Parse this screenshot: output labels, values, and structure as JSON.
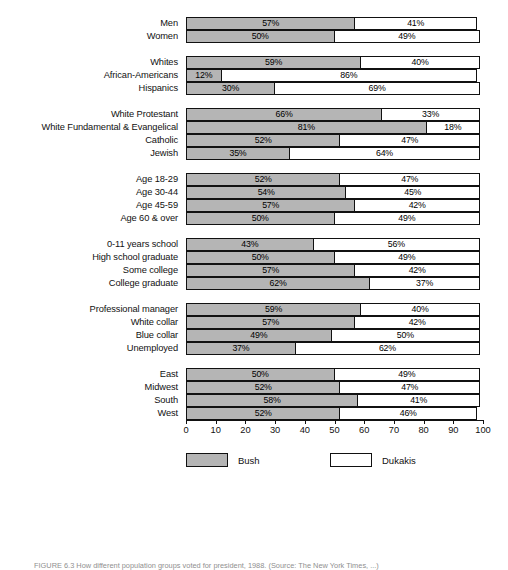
{
  "figure": {
    "caption": "FIGURE 6.3    How different population groups voted for president, 1988. (Source: The New York Times, ...)"
  },
  "legend": {
    "position": "bottom-center",
    "items": [
      {
        "name": "Bush",
        "color": "#b5b5b5"
      },
      {
        "name": "Dukakis",
        "color": "#ffffff"
      }
    ]
  },
  "axis": {
    "ticks": [
      "0",
      "10",
      "20",
      "30",
      "40",
      "50",
      "60",
      "70",
      "80",
      "90",
      "100"
    ],
    "min": 0,
    "max": 100
  },
  "chart_data": {
    "type": "bar",
    "orientation": "horizontal",
    "stacked": true,
    "title": "",
    "xlabel": "",
    "ylabel": "",
    "xlim": [
      0,
      100
    ],
    "grid": false,
    "legend_position": "bottom-center",
    "series": [
      {
        "name": "Bush",
        "color": "#b5b5b5"
      },
      {
        "name": "Dukakis",
        "color": "#ffffff"
      }
    ],
    "groups": [
      {
        "name": "Gender",
        "rows": [
          {
            "category": "Men",
            "bush": 57,
            "dukakis": 41,
            "bush_label": "57%",
            "dukakis_label": "41%"
          },
          {
            "category": "Women",
            "bush": 50,
            "dukakis": 49,
            "bush_label": "50%",
            "dukakis_label": "49%"
          }
        ]
      },
      {
        "name": "Race",
        "rows": [
          {
            "category": "Whites",
            "bush": 59,
            "dukakis": 40,
            "bush_label": "59%",
            "dukakis_label": "40%"
          },
          {
            "category": "African-Americans",
            "bush": 12,
            "dukakis": 86,
            "bush_label": "12%",
            "dukakis_label": "86%"
          },
          {
            "category": "Hispanics",
            "bush": 30,
            "dukakis": 69,
            "bush_label": "30%",
            "dukakis_label": "69%"
          }
        ]
      },
      {
        "name": "Religion",
        "rows": [
          {
            "category": "White Protestant",
            "bush": 66,
            "dukakis": 33,
            "bush_label": "66%",
            "dukakis_label": "33%"
          },
          {
            "category": "White Fundamental & Evangelical",
            "bush": 81,
            "dukakis": 18,
            "bush_label": "81%",
            "dukakis_label": "18%"
          },
          {
            "category": "Catholic",
            "bush": 52,
            "dukakis": 47,
            "bush_label": "52%",
            "dukakis_label": "47%"
          },
          {
            "category": "Jewish",
            "bush": 35,
            "dukakis": 64,
            "bush_label": "35%",
            "dukakis_label": "64%"
          }
        ]
      },
      {
        "name": "Age",
        "rows": [
          {
            "category": "Age 18-29",
            "bush": 52,
            "dukakis": 47,
            "bush_label": "52%",
            "dukakis_label": "47%"
          },
          {
            "category": "Age 30-44",
            "bush": 54,
            "dukakis": 45,
            "bush_label": "54%",
            "dukakis_label": "45%"
          },
          {
            "category": "Age 45-59",
            "bush": 57,
            "dukakis": 42,
            "bush_label": "57%",
            "dukakis_label": "42%"
          },
          {
            "category": "Age 60 & over",
            "bush": 50,
            "dukakis": 49,
            "bush_label": "50%",
            "dukakis_label": "49%"
          }
        ]
      },
      {
        "name": "Education",
        "rows": [
          {
            "category": "0-11 years school",
            "bush": 43,
            "dukakis": 56,
            "bush_label": "43%",
            "dukakis_label": "56%"
          },
          {
            "category": "High school graduate",
            "bush": 50,
            "dukakis": 49,
            "bush_label": "50%",
            "dukakis_label": "49%"
          },
          {
            "category": "Some college",
            "bush": 57,
            "dukakis": 42,
            "bush_label": "57%",
            "dukakis_label": "42%"
          },
          {
            "category": "College graduate",
            "bush": 62,
            "dukakis": 37,
            "bush_label": "62%",
            "dukakis_label": "37%"
          }
        ]
      },
      {
        "name": "Occupation",
        "rows": [
          {
            "category": "Professional manager",
            "bush": 59,
            "dukakis": 40,
            "bush_label": "59%",
            "dukakis_label": "40%"
          },
          {
            "category": "White collar",
            "bush": 57,
            "dukakis": 42,
            "bush_label": "57%",
            "dukakis_label": "42%"
          },
          {
            "category": "Blue collar",
            "bush": 49,
            "dukakis": 50,
            "bush_label": "49%",
            "dukakis_label": "50%"
          },
          {
            "category": "Unemployed",
            "bush": 37,
            "dukakis": 62,
            "bush_label": "37%",
            "dukakis_label": "62%"
          }
        ]
      },
      {
        "name": "Region",
        "rows": [
          {
            "category": "East",
            "bush": 50,
            "dukakis": 49,
            "bush_label": "50%",
            "dukakis_label": "49%"
          },
          {
            "category": "Midwest",
            "bush": 52,
            "dukakis": 47,
            "bush_label": "52%",
            "dukakis_label": "47%"
          },
          {
            "category": "South",
            "bush": 58,
            "dukakis": 41,
            "bush_label": "58%",
            "dukakis_label": "41%"
          },
          {
            "category": "West",
            "bush": 52,
            "dukakis": 46,
            "bush_label": "52%",
            "dukakis_label": "46%"
          }
        ]
      }
    ]
  }
}
